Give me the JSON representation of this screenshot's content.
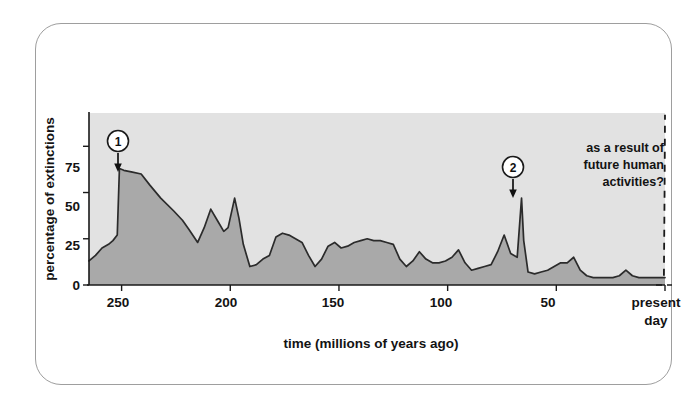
{
  "figure": {
    "kind": "scientific-figure",
    "frame_border_color": "#9e9e9e"
  },
  "colors": {
    "plot_background": "#e2e2e2",
    "series_fill": "#a9a9a9",
    "series_line": "#2b2b2b",
    "axis": "#1a1a1a",
    "text": "#131313",
    "page_background": "#ffffff"
  },
  "annotations": {
    "future": {
      "lines": [
        "as a result of",
        "future human",
        "activities?"
      ],
      "full_text": "as a result of future human activities?",
      "style": "dashed-rising-line"
    },
    "callouts": [
      {
        "id": "callout-1",
        "label": "1",
        "x_value": 251,
        "y_value": 63,
        "marker": "circled-number-with-down-arrow"
      },
      {
        "id": "callout-2",
        "label": "2",
        "x_value": 66,
        "y_value": 47,
        "marker": "circled-number-with-down-arrow"
      }
    ]
  },
  "chart_data": {
    "type": "area",
    "title": "",
    "subtitle": "",
    "xlabel": "time (millions of years ago)",
    "ylabel": "percentage of extinctions",
    "xlim": [
      265,
      0
    ],
    "ylim": [
      0,
      93
    ],
    "x_axis_inverted": true,
    "grid": false,
    "legend": null,
    "legend_position": "none",
    "xticks": [
      250,
      200,
      150,
      100,
      50,
      0
    ],
    "xticklabels": [
      "250",
      "200",
      "150",
      "100",
      "50",
      "present day"
    ],
    "yticks": [
      0,
      25,
      50,
      75
    ],
    "yticklabels": [
      "0",
      "25",
      "50",
      "75"
    ],
    "series": [
      {
        "name": "percentage of extinctions",
        "x": [
          265,
          262,
          259,
          256,
          254,
          252,
          251,
          249,
          245,
          241,
          237,
          232,
          226,
          222,
          219,
          215,
          212,
          209,
          206,
          203,
          201,
          198,
          196,
          194,
          191,
          188,
          185,
          182,
          179,
          176,
          173,
          170,
          167,
          164,
          161,
          158,
          155,
          152,
          149,
          146,
          143,
          140,
          137,
          134,
          131,
          128,
          125,
          122,
          119,
          116,
          113,
          110,
          107,
          104,
          101,
          98,
          95,
          92,
          89,
          86,
          83,
          80,
          77,
          74,
          71,
          68,
          66,
          65,
          63,
          60,
          57,
          54,
          51,
          48,
          45,
          42,
          39,
          36,
          33,
          30,
          27,
          24,
          21,
          18,
          15,
          12,
          9,
          6,
          3,
          1,
          0
        ],
        "y": [
          13,
          16,
          20,
          22,
          24,
          27,
          63,
          62,
          61,
          60,
          54,
          47,
          40,
          35,
          30,
          23,
          31,
          41,
          35,
          29,
          31,
          47,
          36,
          22,
          10,
          11,
          14,
          16,
          26,
          28,
          27,
          25,
          23,
          16,
          10,
          14,
          21,
          23,
          20,
          21,
          23,
          24,
          25,
          24,
          24,
          23,
          22,
          14,
          10,
          13,
          18,
          14,
          12,
          12,
          13,
          15,
          19,
          12,
          8,
          9,
          10,
          11,
          18,
          27,
          17,
          15,
          47,
          24,
          7,
          6,
          7,
          8,
          10,
          12,
          12,
          15,
          8,
          5,
          4,
          4,
          4,
          4,
          5,
          8,
          5,
          4,
          4,
          4,
          4,
          4,
          4
        ],
        "fill": true
      }
    ],
    "future_projection": {
      "x": [
        0.5,
        0.2,
        0.0
      ],
      "y": [
        5,
        50,
        92
      ],
      "style": "dashed",
      "description": "speculative rise in extinction percentage after present day"
    },
    "mass_extinction_events": [
      {
        "callout": "1",
        "time_mya": 251,
        "percent_extinctions": 63
      },
      {
        "callout": "2",
        "time_mya": 66,
        "percent_extinctions": 47
      }
    ]
  }
}
